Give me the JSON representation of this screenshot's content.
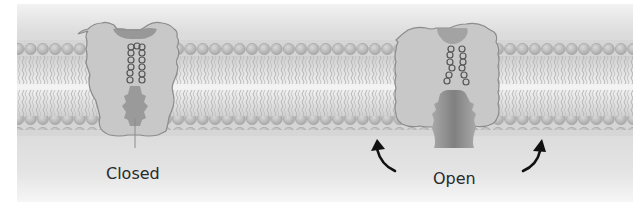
{
  "figure": {
    "colors": {
      "background": "#ffffff",
      "panel": "#e6e6e6",
      "membrane_band": "#d4d4d4",
      "lipid_head": "#bdbdbd",
      "lipid_head_stroke": "#9a9a9a",
      "lipid_tail": "#b0b0b0",
      "protein_fill": "#c9c9c9",
      "protein_stroke": "#8a8a8a",
      "pore_dark": "#8e8e8e",
      "helix_stroke": "#555555",
      "arrow": "#111111",
      "text": "#2a2a2a"
    },
    "channels": [
      {
        "state": "closed",
        "label": "Closed"
      },
      {
        "state": "open",
        "label": "Open"
      }
    ],
    "arrows": [
      {
        "name": "left-open-arrow",
        "direction": "up-left"
      },
      {
        "name": "right-open-arrow",
        "direction": "up-right"
      }
    ]
  }
}
